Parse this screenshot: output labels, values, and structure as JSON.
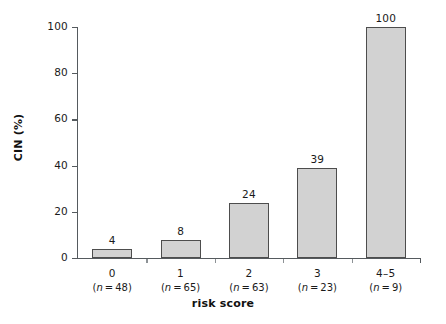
{
  "chart_data": {
    "type": "bar",
    "title": "",
    "subtitle": "",
    "xlabel": "risk score",
    "ylabel": "CIN (%)",
    "categories": [
      "0",
      "1",
      "2",
      "3",
      "4–5"
    ],
    "category_counts": [
      "(n = 48)",
      "(n = 65)",
      "(n = 63)",
      "(n = 23)",
      "(n = 9)"
    ],
    "values": [
      4,
      8,
      24,
      39,
      100
    ],
    "value_labels": [
      "4",
      "8",
      "24",
      "39",
      "100"
    ],
    "ylim": [
      0,
      100
    ],
    "yticks": [
      0,
      20,
      40,
      60,
      80,
      100
    ],
    "ytick_labels": [
      "0",
      "20",
      "40",
      "60",
      "80",
      "100"
    ],
    "xlim_categories": 5,
    "grid": false,
    "legend": false,
    "legend_position": "none",
    "bar_fill_color": "#d2d2d2",
    "bar_edge_color": "#4d4d4d",
    "axis_color": "#555a5e",
    "text_color": "#1a1a1a",
    "background_color": "#ffffff"
  },
  "axes": {
    "y_title": "CIN (%)",
    "x_title": "risk score"
  }
}
